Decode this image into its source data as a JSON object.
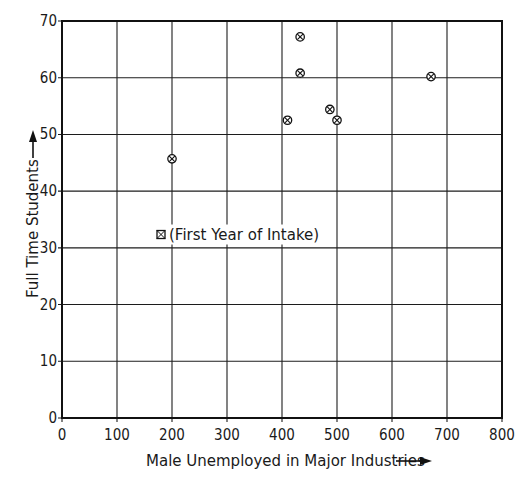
{
  "chart_data": {
    "type": "scatter",
    "title": "",
    "xlabel": "Male Unemployed in Major Industries",
    "ylabel": "Full Time Students",
    "xlim": [
      0,
      800
    ],
    "ylim": [
      0,
      70
    ],
    "x_ticks": [
      0,
      100,
      200,
      300,
      400,
      500,
      600,
      700,
      800
    ],
    "y_ticks": [
      0,
      10,
      20,
      30,
      40,
      50,
      60,
      70
    ],
    "grid": true,
    "marker": "circled-x",
    "legend": [
      {
        "marker": "boxed-x",
        "label": "(First Year of Intake)",
        "position": {
          "x": 180,
          "y": 32
        }
      }
    ],
    "series": [
      {
        "name": "Institutions",
        "points": [
          {
            "x": 200,
            "y": 45.7
          },
          {
            "x": 410,
            "y": 52.5
          },
          {
            "x": 433,
            "y": 67.2
          },
          {
            "x": 433,
            "y": 60.8
          },
          {
            "x": 487,
            "y": 54.4
          },
          {
            "x": 500,
            "y": 52.5
          },
          {
            "x": 671,
            "y": 60.2
          }
        ]
      }
    ]
  },
  "labels": {
    "x_axis": "Male Unemployed in Major Industries",
    "y_axis": "Full Time Students",
    "legend_text": "(First Year of Intake)"
  },
  "colors": {
    "ink": "#111111",
    "background": "#ffffff"
  }
}
